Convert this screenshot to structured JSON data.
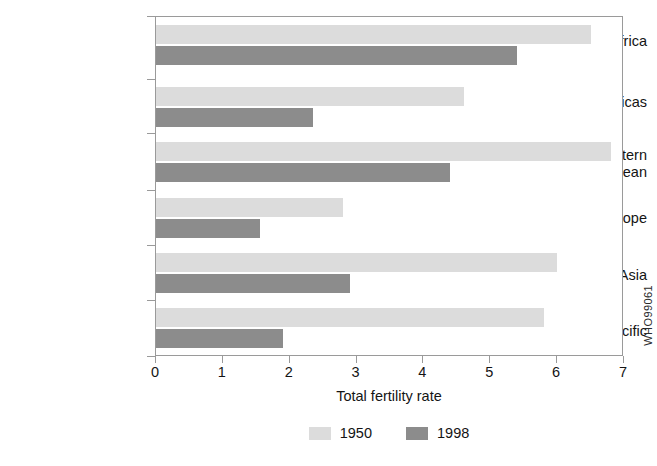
{
  "credit": "WHO99061",
  "chart_data": {
    "type": "bar",
    "orientation": "horizontal",
    "title": "",
    "xlabel": "Total fertility rate",
    "ylabel": "",
    "xlim": [
      0,
      7
    ],
    "xticks": [
      "0",
      "1",
      "2",
      "3",
      "4",
      "5",
      "6",
      "7"
    ],
    "grid": false,
    "legend_position": "bottom-center",
    "categories": [
      "Africa",
      "The Americas",
      "Eastern\nMediterranean",
      "Europe",
      "South-East Asia",
      "Western Pacific"
    ],
    "series": [
      {
        "name": "1950",
        "color": "#dcdcdc",
        "values": [
          6.5,
          4.6,
          6.8,
          2.8,
          6.0,
          5.8
        ]
      },
      {
        "name": "1998",
        "color": "#8c8c8c",
        "values": [
          5.4,
          2.35,
          4.4,
          1.55,
          2.9,
          1.9
        ]
      }
    ]
  }
}
